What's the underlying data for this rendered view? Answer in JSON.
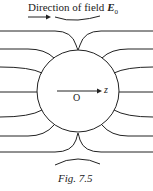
{
  "diagram": {
    "title_text": "Direction of field ",
    "title_symbol": "E",
    "title_subscript": "0",
    "origin_label": "O",
    "axis_label": "z",
    "caption": "Fig. 7.5",
    "sphere": {
      "cx": 78,
      "cy": 91,
      "r": 41
    },
    "field_line_count": 12,
    "colors": {
      "stroke": "#222222",
      "background": "#ffffff"
    }
  }
}
